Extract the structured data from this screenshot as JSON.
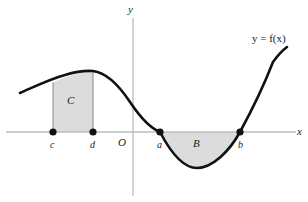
{
  "figure": {
    "kind": "calculus-signed-area-diagram",
    "width": 308,
    "height": 202,
    "background_color": "#ffffff"
  },
  "axes": {
    "x_label": "x",
    "y_label": "y",
    "origin_label": "O",
    "axis_color": "#bdbdbd",
    "x_axis_y_px": 132,
    "y_axis_x_px": 133,
    "x_axis_extent_px": [
      6,
      296
    ],
    "y_axis_extent_px": [
      18,
      196
    ]
  },
  "curve": {
    "label": "y = f(x)",
    "color": "#111111",
    "stroke_width": 2.6,
    "peak_px": [
      93,
      71
    ],
    "trough_px": [
      197,
      168
    ],
    "start_px": [
      20,
      93
    ],
    "end_px": [
      287,
      47
    ]
  },
  "points": [
    {
      "id": "c",
      "label": "c",
      "x_px": 53,
      "y_px": 132
    },
    {
      "id": "d",
      "label": "d",
      "x_px": 93,
      "y_px": 132
    },
    {
      "id": "a",
      "label": "a",
      "x_px": 160,
      "y_px": 132
    },
    {
      "id": "b",
      "label": "b",
      "x_px": 240,
      "y_px": 132
    }
  ],
  "regions": [
    {
      "id": "C",
      "label": "C",
      "position": "above-axis",
      "from_point": "c",
      "to_point": "d",
      "fill_color": "#dcdcdc",
      "edge_color": "#8c8c8c",
      "label_px": [
        71,
        101
      ]
    },
    {
      "id": "B",
      "label": "B",
      "position": "below-axis",
      "from_point": "a",
      "to_point": "b",
      "fill_color": "#dcdcdc",
      "edge_color": "#8c8c8c",
      "label_px": [
        197,
        144
      ]
    }
  ],
  "labels": {
    "curve_label_px": [
      255,
      38
    ],
    "x_label_px": [
      297,
      127
    ],
    "y_label_px": [
      128,
      4
    ],
    "origin_label_px": [
      118,
      138
    ]
  },
  "colors": {
    "shade": "#dcdcdc",
    "curve": "#111111",
    "axis": "#bdbdbd",
    "text": "#1a1a1a",
    "dot": "#111111"
  }
}
